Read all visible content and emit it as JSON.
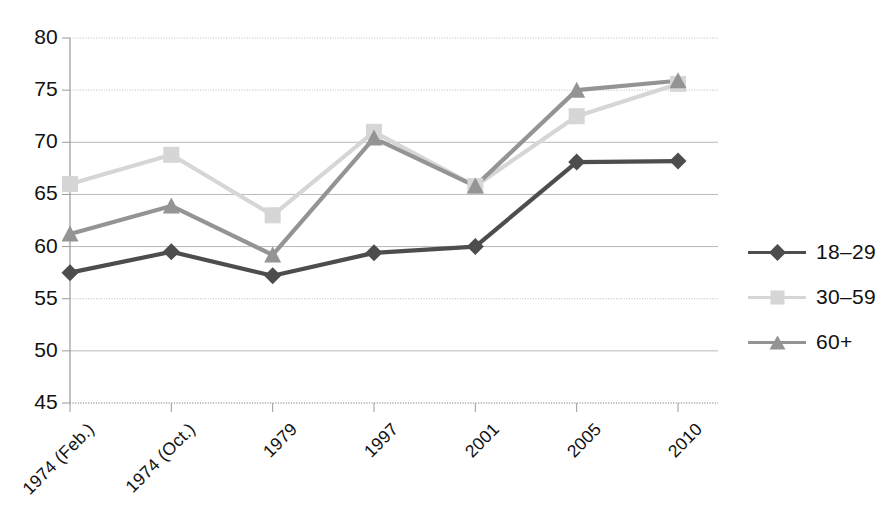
{
  "chart_data": {
    "type": "line",
    "title": "",
    "xlabel": "",
    "ylabel": "",
    "categories": [
      "1974 (Feb.)",
      "1974 (Oct.)",
      "1979",
      "1997",
      "2001",
      "2005",
      "2010"
    ],
    "ylim": [
      45,
      80
    ],
    "yticks": [
      45,
      50,
      55,
      60,
      65,
      70,
      75,
      80
    ],
    "ytick_labels": [
      "45",
      "50",
      "55",
      "60",
      "65",
      "70",
      "75",
      "80"
    ],
    "grid": true,
    "legend_position": "right",
    "series": [
      {
        "name": "18–29",
        "marker": "diamond",
        "color": "#4d4d4d",
        "values": [
          57.5,
          59.5,
          57.2,
          59.4,
          60.0,
          68.1,
          68.2
        ]
      },
      {
        "name": "30–59",
        "marker": "square",
        "color": "#d6d6d6",
        "values": [
          66.0,
          68.8,
          63.0,
          71.0,
          65.8,
          72.5,
          75.6
        ]
      },
      {
        "name": "60+",
        "marker": "triangle",
        "color": "#949494",
        "values": [
          61.2,
          63.9,
          59.2,
          70.4,
          65.8,
          75.0,
          75.9
        ]
      }
    ]
  },
  "legend": {
    "items": [
      {
        "label": "18–29"
      },
      {
        "label": "30–59"
      },
      {
        "label": "60+"
      }
    ]
  },
  "axis": {
    "y_labels": [
      "80",
      "75",
      "70",
      "65",
      "60",
      "55",
      "50",
      "45"
    ],
    "x_labels": [
      "1974 (Feb.)",
      "1974 (Oct.)",
      "1979",
      "1997",
      "2001",
      "2005",
      "2010"
    ]
  },
  "colors": {
    "series_18_29": "#4d4d4d",
    "series_30_59": "#d6d6d6",
    "series_60_plus": "#949494",
    "gridline": "#b8b8b8",
    "axis": "#9a9a9a",
    "text": "#111111",
    "background": "#ffffff"
  }
}
